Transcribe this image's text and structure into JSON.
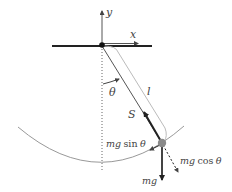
{
  "diagram": {
    "labels": {
      "y_axis": "y",
      "x_axis": "x",
      "angle": "θ",
      "length": "l",
      "tension": "S",
      "tangential_force_prefix": "mg",
      "tangential_force_func": "sin",
      "tangential_force_arg": "θ",
      "radial_force_prefix": "mg",
      "radial_force_func": "cos",
      "radial_force_arg": "θ",
      "weight": "mg"
    },
    "colors": {
      "ink": "#222222",
      "label": "#444444",
      "arc": "#999999",
      "length_bracket": "#bbbbbb",
      "bob": "#8a8a8a",
      "dotted": "#666666"
    }
  }
}
